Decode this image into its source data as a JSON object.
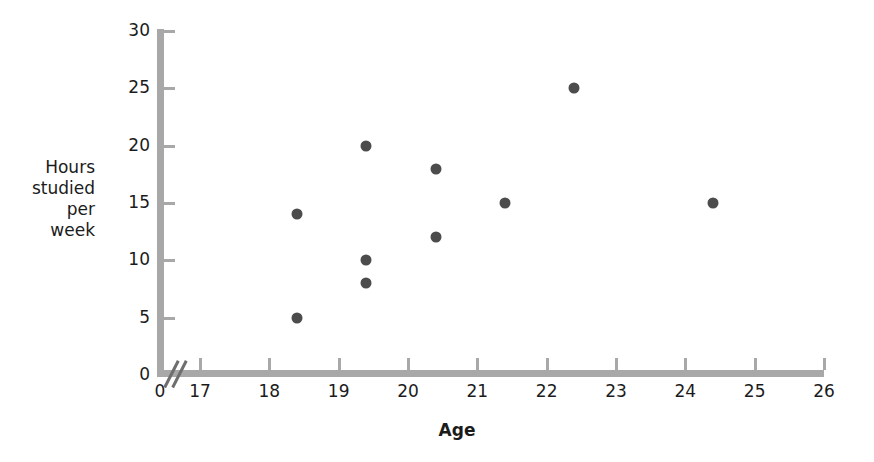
{
  "chart_data": {
    "type": "scatter",
    "title": "",
    "xlabel": "Age",
    "ylabel": "Hours studied per week",
    "ylabel_lines": [
      "Hours",
      "studied",
      "per",
      "week"
    ],
    "xlim": [
      17,
      26
    ],
    "ylim": [
      0,
      30
    ],
    "x_ticks": [
      17,
      18,
      19,
      20,
      21,
      22,
      23,
      24,
      25,
      26
    ],
    "x_tick_labels": [
      "17",
      "18",
      "19",
      "20",
      "21",
      "22",
      "23",
      "24",
      "25",
      "26"
    ],
    "y_ticks": [
      0,
      5,
      10,
      15,
      20,
      25,
      30
    ],
    "y_tick_labels": [
      "0",
      "5",
      "10",
      "15",
      "20",
      "25",
      "30"
    ],
    "origin_label": "0",
    "axis_break": true,
    "grid": false,
    "legend": null,
    "marker_color": "#4c4c4c",
    "axis_color": "#a8a8a8",
    "points": [
      {
        "x": 18.4,
        "y": 14
      },
      {
        "x": 18.4,
        "y": 5
      },
      {
        "x": 19.4,
        "y": 20
      },
      {
        "x": 19.4,
        "y": 10
      },
      {
        "x": 19.4,
        "y": 8
      },
      {
        "x": 20.4,
        "y": 18
      },
      {
        "x": 20.4,
        "y": 12
      },
      {
        "x": 21.4,
        "y": 15
      },
      {
        "x": 22.4,
        "y": 25
      },
      {
        "x": 24.4,
        "y": 15
      }
    ]
  }
}
